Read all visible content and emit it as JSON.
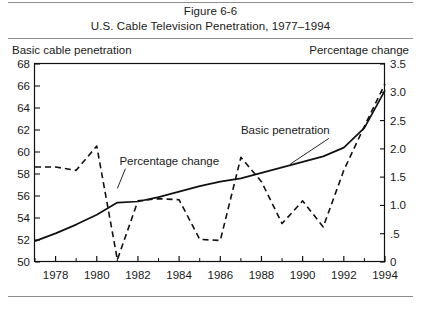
{
  "figure": {
    "title_line1": "Figure 6-6",
    "title_line2": "U.S. Cable Television Penetration, 1977–1994",
    "left_caption": "Basic cable penetration",
    "right_caption": "Percentage change"
  },
  "chart_data": {
    "type": "line",
    "title": "U.S. Cable Television Penetration, 1977–1994",
    "subtitle": "Figure 6-6",
    "xlabel": "",
    "ylabel": "Basic cable penetration",
    "y2label": "Percentage change",
    "grid": false,
    "legend_position": "inline-annotation",
    "xlim": [
      1977,
      1994
    ],
    "ylim": [
      50,
      68
    ],
    "y2lim": [
      0,
      3.5
    ],
    "x_ticks": [
      1978,
      1980,
      1982,
      1984,
      1986,
      1988,
      1990,
      1992,
      1994
    ],
    "x_tick_labels": [
      "1978",
      "1980",
      "1982",
      "1984",
      "1986",
      "1988",
      "1990",
      "1992",
      "1994"
    ],
    "x_minor_ticks": [
      1977,
      1979,
      1981,
      1983,
      1985,
      1987,
      1989,
      1991,
      1993
    ],
    "y_ticks": [
      50,
      52,
      54,
      56,
      58,
      60,
      62,
      64,
      66,
      68
    ],
    "y_tick_labels": [
      "50",
      "52",
      "54",
      "56",
      "58",
      "60",
      "62",
      "64",
      "66",
      "68"
    ],
    "y2_ticks": [
      0,
      0.5,
      1.0,
      1.5,
      2.0,
      2.5,
      3.0,
      3.5
    ],
    "y2_tick_labels": [
      "0",
      ".5",
      "1.0",
      "1.5",
      "2.0",
      "2.5",
      "3.0",
      "3.5"
    ],
    "x": [
      1977,
      1978,
      1979,
      1980,
      1981,
      1982,
      1983,
      1984,
      1985,
      1986,
      1987,
      1988,
      1989,
      1990,
      1991,
      1992,
      1993,
      1994
    ],
    "series": [
      {
        "name": "Basic penetration",
        "axis": "left",
        "style": "solid",
        "color": "#111111",
        "annotation": "Basic penetration",
        "values": [
          51.9,
          52.6,
          53.4,
          54.3,
          55.4,
          55.5,
          55.9,
          56.4,
          56.9,
          57.3,
          57.6,
          58.1,
          58.6,
          59.1,
          59.6,
          60.4,
          62.2,
          65.6
        ]
      },
      {
        "name": "Percentage change",
        "axis": "right",
        "style": "dashed",
        "color": "#111111",
        "annotation": "Percentage change",
        "values": [
          1.68,
          1.68,
          1.62,
          2.05,
          0.04,
          1.08,
          1.12,
          1.1,
          0.4,
          0.38,
          1.85,
          1.42,
          0.68,
          1.08,
          0.62,
          1.62,
          2.4,
          3.15
        ]
      }
    ],
    "annotations": [
      {
        "text": "Percentage change",
        "x": 1981.1,
        "y2_anchor": 1.72,
        "leader_to_x": 1981.0,
        "leader_to_y2": 1.3
      },
      {
        "text": "Basic penetration",
        "x": 1987.0,
        "y_anchor": 61.6,
        "leader_to_x": 1989.4,
        "leader_to_y": 58.9
      }
    ]
  }
}
